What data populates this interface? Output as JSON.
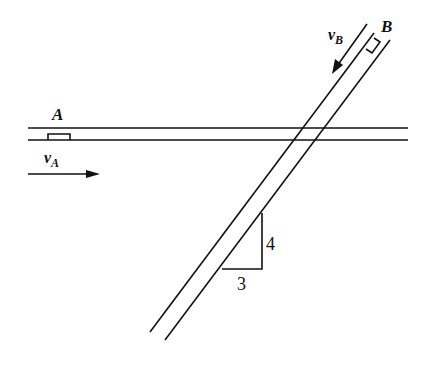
{
  "diagram": {
    "type": "physics-kinematics",
    "labels": {
      "car_a": "A",
      "car_b": "B",
      "velocity_a": "v",
      "velocity_a_sub": "A",
      "velocity_b": "v",
      "velocity_b_sub": "B",
      "slope_run": "3",
      "slope_rise": "4"
    },
    "colors": {
      "line": "#111111",
      "background": "#ffffff"
    }
  }
}
